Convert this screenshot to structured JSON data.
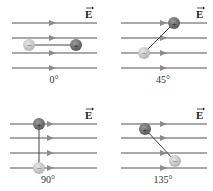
{
  "figure": {
    "field_symbol": "E",
    "colors": {
      "field_line": "#8c8c8c",
      "arrow_head": "#8c8c8c",
      "positive_charge": "#6e6e6e",
      "negative_charge": "#c8c8c8",
      "dipole_rod": "#444444",
      "text": "#222222"
    },
    "panels": [
      {
        "id": "p0",
        "angle_label": "0°",
        "positive_sign": "+",
        "negative_sign": "−"
      },
      {
        "id": "p45",
        "angle_label": "45°",
        "positive_sign": "+",
        "negative_sign": "−"
      },
      {
        "id": "p90",
        "angle_label": "90°",
        "positive_sign": "+",
        "negative_sign": "−"
      },
      {
        "id": "p135",
        "angle_label": "135°",
        "positive_sign": "+",
        "negative_sign": "−"
      }
    ]
  }
}
